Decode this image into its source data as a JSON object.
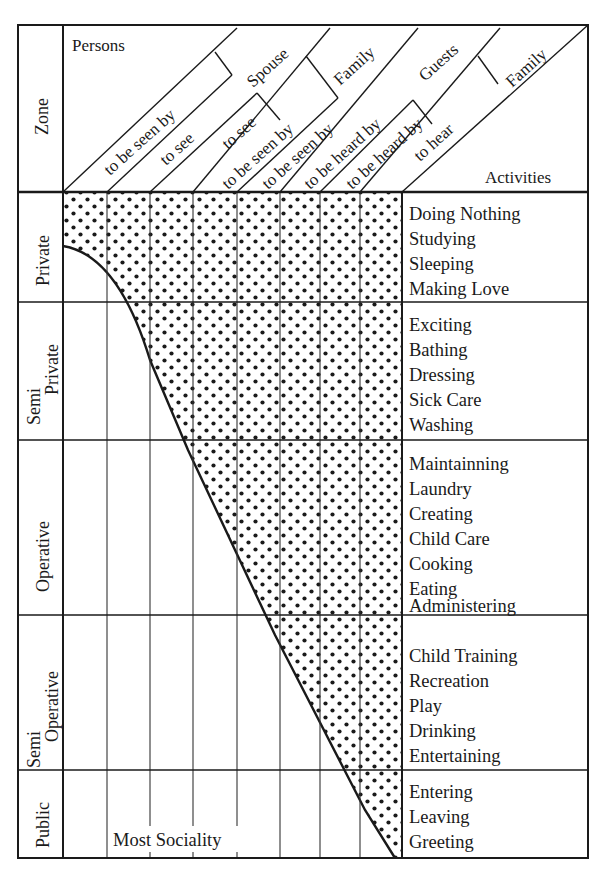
{
  "diagram": {
    "header": {
      "persons_label": "Persons",
      "activities_label": "Activities",
      "zone_label": "Zone",
      "diagonal_labels": [
        "to be seen by",
        "to see",
        "to see",
        "to be seen by",
        "to be seen by",
        "to be heard by",
        "to be heard by",
        "to hear"
      ],
      "group_labels": [
        "Spouse",
        "Family",
        "Guests",
        "Family"
      ]
    },
    "zones": [
      {
        "name": "Private",
        "name_line2": "",
        "activities": [
          "Doing Nothing",
          "Studying",
          "Sleeping",
          "Making Love"
        ]
      },
      {
        "name": "Semi",
        "name_line2": "Private",
        "activities": [
          "Exciting",
          "Bathing",
          "Dressing",
          "Sick Care",
          "Washing"
        ]
      },
      {
        "name": "Operative",
        "name_line2": "",
        "activities": [
          "Maintainning",
          "Laundry",
          "Creating",
          "Child Care",
          "Cooking",
          "Eating",
          "Administering"
        ]
      },
      {
        "name": "Semi",
        "name_line2": "Operative",
        "activities": [
          "Child Training",
          "Recreation",
          "Play",
          "Drinking",
          "Entertaining"
        ]
      },
      {
        "name": "Public",
        "name_line2": "",
        "activities": [
          "Entering",
          "Leaving",
          "Greeting"
        ]
      }
    ],
    "footer_label": "Most Sociality",
    "colors": {
      "ink": "#1a1a1a",
      "paper": "#ffffff"
    }
  }
}
